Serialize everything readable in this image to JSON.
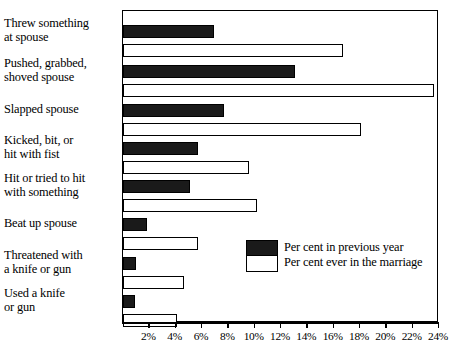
{
  "chart_data": {
    "type": "bar",
    "orientation": "horizontal",
    "title": "",
    "xlabel": "",
    "ylabel": "",
    "xlim": [
      0,
      24
    ],
    "xtick_step": 2,
    "grid": false,
    "legend_position": "inside-lower-right",
    "xticks": [
      "2%",
      "4%",
      "6%",
      "8%",
      "10%",
      "12%",
      "14%",
      "16%",
      "18%",
      "20%",
      "22%",
      "24%"
    ],
    "xtick_values": [
      2,
      4,
      6,
      8,
      10,
      12,
      14,
      16,
      18,
      20,
      22,
      24
    ],
    "categories": [
      "Threw something\nat spouse",
      "Pushed, grabbed,\nshoved spouse",
      "Slapped spouse",
      "Kicked, bit, or\nhit with fist",
      "Hit or tried to hit\nwith something",
      "Beat up spouse",
      "Threatened with\na knife or gun",
      "Used a knife\nor gun"
    ],
    "category_lines": [
      [
        "Threw something",
        "at spouse"
      ],
      [
        "Pushed, grabbed,",
        "shoved spouse"
      ],
      [
        "Slapped spouse"
      ],
      [
        "Kicked, bit, or",
        "hit with fist"
      ],
      [
        "Hit or tried to hit",
        "with something"
      ],
      [
        "Beat up spouse"
      ],
      [
        "Threatened with",
        "a knife or gun"
      ],
      [
        "Used a knife",
        "or gun"
      ]
    ],
    "series": [
      {
        "name": "Per cent in previous year",
        "color": "#1a1a1a",
        "values": [
          6.9,
          13.1,
          7.7,
          5.7,
          5.1,
          1.8,
          1.0,
          0.9
        ]
      },
      {
        "name": "Per cent ever in the marriage",
        "color": "#ffffff",
        "values": [
          16.7,
          23.6,
          18.1,
          9.6,
          10.2,
          5.7,
          4.6,
          4.1
        ]
      }
    ]
  },
  "legend": {
    "items": [
      {
        "label": "Per cent in previous year",
        "swatch": "filled-black"
      },
      {
        "label": "Per cent ever in the marriage",
        "swatch": "outlined-white"
      }
    ]
  },
  "axis": {
    "x_min_percent": 0,
    "x_max_percent": 24
  }
}
